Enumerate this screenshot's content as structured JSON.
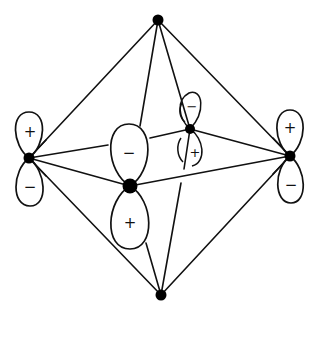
{
  "diagram": {
    "title": "",
    "colors": {
      "line": "#111111",
      "vertex": "#000000",
      "background": "#ffffff"
    },
    "vertices": {
      "top": [
        158,
        20
      ],
      "bottom": [
        161,
        295
      ],
      "left": [
        29,
        158
      ],
      "right": [
        290,
        156
      ],
      "front": [
        130,
        186
      ],
      "back": [
        190,
        129
      ]
    },
    "lobe_signs": {
      "left_upper": "+",
      "left_lower": "−",
      "right_upper": "+",
      "right_lower": "−",
      "front_upper": "−",
      "front_lower": "+",
      "back_upper": "−",
      "back_lower": "+"
    }
  }
}
